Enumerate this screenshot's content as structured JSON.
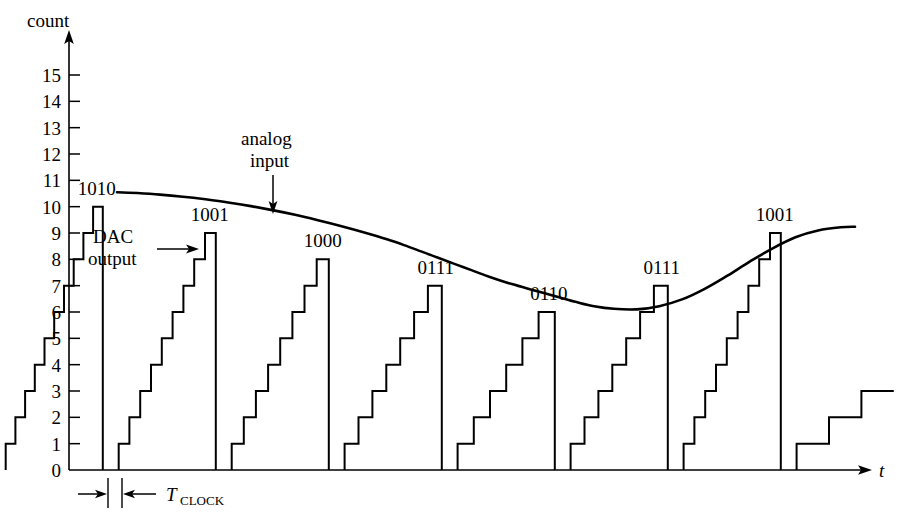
{
  "figure": {
    "kind": "adc-ramp-timing-diagram",
    "y_axis_title": "count",
    "x_axis_title": "t",
    "annotations": {
      "dac_output_line1": "DAC",
      "dac_output_line2": "output",
      "analog_input_line1": "analog",
      "analog_input_line2": "input",
      "tclock_base": "T",
      "tclock_sub": "CLOCK"
    }
  },
  "chart_data": {
    "type": "line",
    "title": "",
    "xlabel": "t",
    "ylabel": "count",
    "ylim": [
      0,
      15
    ],
    "xlim": [
      0,
      8
    ],
    "grid": false,
    "legend": null,
    "y_ticks": [
      0,
      1,
      2,
      3,
      4,
      5,
      6,
      7,
      8,
      9,
      10,
      11,
      12,
      13,
      14,
      15
    ],
    "y_tick_labels": [
      "0",
      "1",
      "2",
      "3",
      "4",
      "5",
      "6",
      "7",
      "8",
      "9",
      "10",
      "11",
      "12",
      "13",
      "14",
      "15"
    ],
    "x_ticks": [],
    "series": [
      {
        "name": "analog input",
        "type": "line",
        "description": "smooth analog waveform sampled by the converter",
        "x": [
          0.04,
          0.4,
          0.8,
          1.2,
          1.6,
          2.0,
          2.4,
          2.8,
          3.2,
          3.6,
          4.0,
          4.4,
          4.8,
          5.1,
          5.4,
          5.7,
          6.0,
          6.3,
          6.6,
          7.0,
          7.4,
          7.8,
          8.1,
          8.45,
          8.8,
          9.2,
          9.6,
          10.0,
          10.4,
          10.8,
          11.2,
          11.6,
          12.0,
          12.4,
          12.8,
          13.05
        ],
        "y": [
          10.55,
          10.52,
          10.46,
          10.38,
          10.28,
          10.16,
          10.02,
          9.86,
          9.68,
          9.48,
          9.26,
          9.02,
          8.76,
          8.54,
          8.3,
          8.06,
          7.82,
          7.58,
          7.34,
          7.06,
          6.82,
          6.58,
          6.4,
          6.22,
          6.12,
          6.1,
          6.22,
          6.48,
          6.88,
          7.38,
          7.92,
          8.42,
          8.84,
          9.1,
          9.22,
          9.24
        ]
      },
      {
        "name": "DAC output",
        "type": "staircase",
        "description": "counter-driven DAC staircase; each ramp counts up one LSB per clock until it crosses the analog input, then resets to zero",
        "ramps": [
          {
            "peak": 10,
            "code": "1010",
            "label_visible": true
          },
          {
            "peak": 9,
            "code": "1001",
            "label_visible": true
          },
          {
            "peak": 8,
            "code": "1000",
            "label_visible": true
          },
          {
            "peak": 7,
            "code": "0111",
            "label_visible": true
          },
          {
            "peak": 6,
            "code": "0110",
            "label_visible": true
          },
          {
            "peak": 7,
            "code": "0111",
            "label_visible": true
          },
          {
            "peak": 9,
            "code": "1001",
            "label_visible": true
          },
          {
            "peak": 3,
            "code": "",
            "label_visible": false
          }
        ]
      }
    ],
    "digital_codes": [
      "1010",
      "1001",
      "1000",
      "0111",
      "0110",
      "0111",
      "1001"
    ],
    "annotations": [
      {
        "text": "DAC output",
        "kind": "arrow-label",
        "points_to": "staircase"
      },
      {
        "text": "analog input",
        "kind": "arrow-label",
        "points_to": "analog curve"
      },
      {
        "text": "T_CLOCK",
        "kind": "dimension",
        "description": "one clock period marked at the base of the first ramp"
      }
    ]
  }
}
